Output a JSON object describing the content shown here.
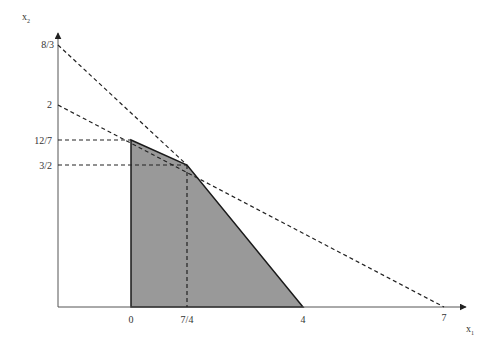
{
  "diagram": {
    "type": "linear-programming-feasible-region",
    "axes": {
      "x_label": "x",
      "x_subscript": "1",
      "y_label": "x",
      "y_subscript": "2"
    },
    "x_ticks": [
      {
        "label": "0",
        "px": 131
      },
      {
        "label": "7/4",
        "px": 187
      },
      {
        "label": "4",
        "px": 303
      },
      {
        "label": "7",
        "px": 444
      }
    ],
    "y_ticks": [
      {
        "label": "8/3",
        "py": 45
      },
      {
        "label": "2",
        "py": 105
      },
      {
        "label": "12/7",
        "py": 140
      },
      {
        "label": "3/2",
        "py": 165
      }
    ],
    "feasible_region": {
      "fill": "#999999",
      "stroke": "#1a1a1a",
      "vertices_px": [
        [
          131,
          307
        ],
        [
          131,
          140
        ],
        [
          187,
          165
        ],
        [
          303,
          307
        ]
      ]
    },
    "constraint_lines": [
      {
        "name": "line-from-8/3",
        "from": [
          58,
          45
        ],
        "to": [
          187,
          165
        ],
        "style": "dashed"
      },
      {
        "name": "line-from-2-to-7",
        "from": [
          58,
          105
        ],
        "to": [
          444,
          307
        ],
        "style": "dashed"
      }
    ],
    "guide_lines": [
      {
        "name": "guide-12/7",
        "from": [
          58,
          140
        ],
        "to": [
          131,
          140
        ]
      },
      {
        "name": "guide-3/2",
        "from": [
          58,
          165
        ],
        "to": [
          187,
          165
        ]
      },
      {
        "name": "guide-7/4",
        "from": [
          187,
          165
        ],
        "to": [
          187,
          307
        ]
      }
    ],
    "colors": {
      "axis": "#555555",
      "line": "#222222",
      "fill": "#999999"
    }
  }
}
